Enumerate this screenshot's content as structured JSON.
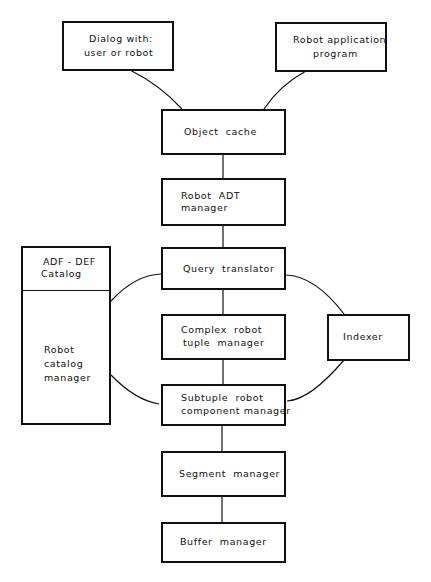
{
  "diagram": {
    "nodes": {
      "dialog": {
        "line1": "Dialog with:",
        "line2": "user or robot"
      },
      "app": {
        "line1": "Robot application",
        "line2": "program"
      },
      "object_cache": {
        "label": "Object  cache"
      },
      "adt": {
        "line1": "Robot  ADT",
        "line2": "manager"
      },
      "query": {
        "label": "Query  translator"
      },
      "complex": {
        "line1": "Complex  robot",
        "line2": "tuple  manager"
      },
      "subtuple": {
        "line1": "Subtuple  robot",
        "line2": "component manager"
      },
      "segment": {
        "label": "Segment  manager"
      },
      "buffer": {
        "label": "Buffer  manager"
      },
      "catalog": {
        "line1": "ADF - DEF",
        "line2": "Catalog",
        "line3": "Robot",
        "line4": "catalog",
        "line5": "manager"
      },
      "indexer": {
        "label": "Indexer"
      }
    },
    "edges": [
      [
        "dialog",
        "object_cache"
      ],
      [
        "app",
        "object_cache"
      ],
      [
        "object_cache",
        "adt"
      ],
      [
        "adt",
        "query"
      ],
      [
        "query",
        "complex"
      ],
      [
        "complex",
        "subtuple"
      ],
      [
        "subtuple",
        "segment"
      ],
      [
        "segment",
        "buffer"
      ],
      [
        "catalog",
        "query"
      ],
      [
        "catalog",
        "subtuple"
      ],
      [
        "indexer",
        "query"
      ],
      [
        "indexer",
        "subtuple"
      ]
    ]
  }
}
